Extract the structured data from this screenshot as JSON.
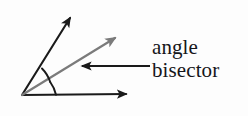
{
  "figure": {
    "kind": "geometry-diagram",
    "background_color": "#fdfdfd",
    "ink_color": "#15161a",
    "bisector_color": "#7b7b7b",
    "vertex": {
      "x": 22,
      "y": 95
    },
    "rays": [
      {
        "name": "upper-ray",
        "role": "angle-side",
        "color": "#1a1a1a",
        "from": {
          "x": 22,
          "y": 95
        },
        "to": {
          "x": 72,
          "y": 14
        },
        "arrowhead": "filled-triangle"
      },
      {
        "name": "bisector-ray",
        "role": "angle-bisector",
        "color": "#7b7b7b",
        "from": {
          "x": 22,
          "y": 95
        },
        "to": {
          "x": 119,
          "y": 35
        },
        "arrowhead": "filled-triangle"
      },
      {
        "name": "lower-ray",
        "role": "angle-side",
        "color": "#1a1a1a",
        "from": {
          "x": 22,
          "y": 95
        },
        "to": {
          "x": 130,
          "y": 94
        },
        "arrowhead": "filled-triangle"
      }
    ],
    "angle_marks": [
      {
        "name": "upper-angle-arc",
        "between": [
          "upper-ray",
          "bisector-ray"
        ],
        "radius": 34
      },
      {
        "name": "lower-angle-arc",
        "between": [
          "bisector-ray",
          "lower-ray"
        ],
        "radius": 34
      }
    ],
    "leader": {
      "name": "label-leader-arrow",
      "color": "#1a1a1a",
      "from": {
        "x": 150,
        "y": 66
      },
      "to": {
        "x": 79,
        "y": 66
      },
      "direction": "left",
      "arrowhead": "filled-triangle"
    }
  },
  "label": {
    "line1": "angle",
    "line2": "bisector"
  }
}
